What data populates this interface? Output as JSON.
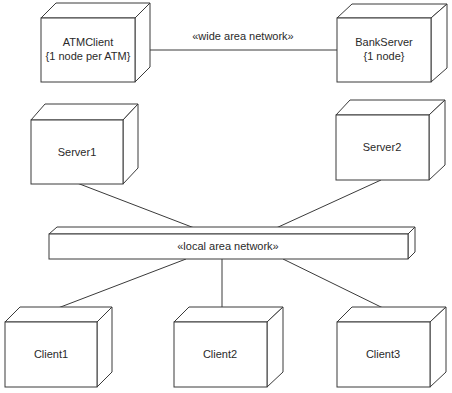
{
  "diagram": {
    "type": "UML deployment diagram",
    "nodes": [
      {
        "id": "atmclient",
        "label": "ATMClient",
        "sublabel": "{1 node per ATM}"
      },
      {
        "id": "bankserver",
        "label": "BankServer",
        "sublabel": "{1 node}"
      },
      {
        "id": "server1",
        "label": "Server1"
      },
      {
        "id": "server2",
        "label": "Server2"
      },
      {
        "id": "lan",
        "label": "«local area network»"
      },
      {
        "id": "client1",
        "label": "Client1"
      },
      {
        "id": "client2",
        "label": "Client2"
      },
      {
        "id": "client3",
        "label": "Client3"
      }
    ],
    "edges": [
      {
        "from": "atmclient",
        "to": "bankserver",
        "label": "«wide area network»"
      },
      {
        "from": "server1",
        "to": "lan",
        "label": ""
      },
      {
        "from": "server2",
        "to": "lan",
        "label": ""
      },
      {
        "from": "lan",
        "to": "client1",
        "label": ""
      },
      {
        "from": "lan",
        "to": "client2",
        "label": ""
      },
      {
        "from": "lan",
        "to": "client3",
        "label": ""
      }
    ],
    "colors": {
      "line": "#3a3a3a",
      "text": "#2a2a2a",
      "background": "#ffffff"
    }
  }
}
